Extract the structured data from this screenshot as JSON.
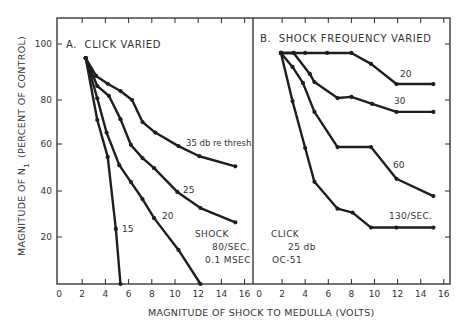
{
  "chart_data": [
    {
      "type": "line",
      "panel": "A",
      "title": "A.  CLICK VARIED",
      "xlabel": "MAGNITUDE OF SHOCK TO MEDULLA (VOLTS)",
      "ylabel": "MAGNITUDE OF N1 (PERCENT OF CONTROL)",
      "xlim": [
        0,
        16.6
      ],
      "ylim": [
        0,
        105
      ],
      "xticks": [
        0,
        2,
        4,
        6,
        8,
        10,
        12,
        14,
        16
      ],
      "yticks": [
        20,
        40,
        60,
        80,
        100
      ],
      "grid": false,
      "annotation": [
        "SHOCK",
        "80/SEC.",
        "0.1 MSEC"
      ],
      "series": [
        {
          "name": "35 db re thresh.",
          "x": [
            2.3,
            3.2,
            4.2,
            5.3,
            6.3,
            7.2,
            8.3,
            10.3,
            12.1,
            15.2
          ],
          "y": [
            95,
            88.6,
            85.8,
            83.2,
            80,
            70,
            65.2,
            59.1,
            54.8,
            50.5
          ]
        },
        {
          "name": "25",
          "x": [
            2.3,
            3.3,
            4.3,
            5.3,
            6.2,
            7.2,
            8.2,
            10.2,
            12.2,
            15.2
          ],
          "y": [
            95,
            85,
            81.5,
            71.3,
            59.6,
            54,
            49.7,
            39.6,
            32.6,
            26.4
          ]
        },
        {
          "name": "20",
          "x": [
            2.3,
            3.3,
            4.1,
            5.2,
            6.2,
            7.2,
            8.2,
            10.3,
            12.2
          ],
          "y": [
            95,
            80.6,
            65.2,
            51,
            43.8,
            36.5,
            28.2,
            14.5,
            0
          ]
        },
        {
          "name": "15",
          "x": [
            2.3,
            3.3,
            4.2,
            4.9,
            5.3
          ],
          "y": [
            95,
            70.9,
            54.5,
            23.5,
            0
          ]
        }
      ]
    },
    {
      "type": "line",
      "panel": "B",
      "title": "B.  SHOCK FREQUENCY VARIED",
      "xlabel": "MAGNITUDE OF SHOCK TO MEDULLA (VOLTS)",
      "ylabel": "MAGNITUDE OF N1 (PERCENT OF CONTROL)",
      "xlim": [
        0,
        16.6
      ],
      "ylim": [
        0,
        105
      ],
      "xticks": [
        0,
        2,
        4,
        6,
        8,
        10,
        12,
        14,
        16
      ],
      "yticks": [
        20,
        40,
        60,
        80,
        100
      ],
      "grid": false,
      "annotation": [
        "CLICK",
        "25 db",
        "OC-51"
      ],
      "series": [
        {
          "name": "20",
          "x": [
            1.9,
            3,
            4,
            5.9,
            8,
            9.7,
            11.9,
            15.1
          ],
          "y": [
            96.8,
            96.8,
            96.8,
            96.8,
            96.8,
            92.9,
            85.7,
            85.7
          ]
        },
        {
          "name": "30",
          "x": [
            1.9,
            3,
            4.4,
            4.8,
            6.8,
            8,
            9.8,
            11.9,
            15.1
          ],
          "y": [
            96.8,
            96.8,
            89.3,
            86.4,
            80.7,
            81.1,
            78.2,
            74.6,
            74.6
          ]
        },
        {
          "name": "60",
          "x": [
            1.9,
            2.9,
            3.8,
            4.8,
            6.8,
            9.7,
            11.9,
            15.1
          ],
          "y": [
            96.8,
            91.8,
            86.1,
            74.6,
            58.7,
            58.7,
            45.2,
            37.8
          ]
        },
        {
          "name": "130/SEC.",
          "x": [
            1.9,
            2.9,
            4,
            4.8,
            6.8,
            8.1,
            9.7,
            11.9,
            15.1
          ],
          "y": [
            96.8,
            79.5,
            58.3,
            43.9,
            32.3,
            30.6,
            24.1,
            24.1,
            24.1
          ]
        }
      ]
    }
  ],
  "labels": {
    "panel_a_title": "A.  CLICK VARIED",
    "panel_b_title": "B.  SHOCK FREQUENCY VARIED",
    "x_axis_label": "MAGNITUDE OF SHOCK TO MEDULLA (VOLTS)",
    "y_axis_label_main": "MAGNITUDE OF N",
    "y_axis_label_sub": "1",
    "y_axis_label_tail": "(PERCENT OF CONTROL)",
    "a_series_labels": [
      "35 db re thresh.",
      "25",
      "20",
      "15"
    ],
    "b_series_labels": [
      "20",
      "30",
      "60",
      "130/SEC."
    ],
    "a_note": [
      "SHOCK",
      "80/SEC.",
      "0.1 MSEC"
    ],
    "b_note": [
      "CLICK",
      "25 db",
      "OC-51"
    ],
    "x_ticks": [
      "0",
      "2",
      "4",
      "6",
      "8",
      "10",
      "12",
      "14",
      "16"
    ],
    "y_ticks": [
      "20",
      "40",
      "60",
      "80",
      "100"
    ]
  },
  "colors": {
    "line": "#1e1e1e",
    "axis": "#2a2a2a",
    "text": "#333333"
  }
}
